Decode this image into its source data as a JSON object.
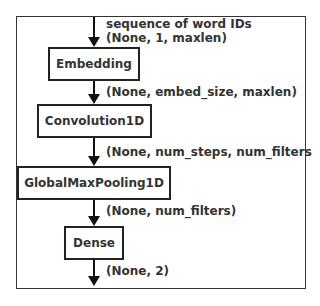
{
  "diagram": {
    "type": "model-architecture-flowchart",
    "nodes": [
      {
        "id": "embedding",
        "label": "Embedding"
      },
      {
        "id": "conv1d",
        "label": "Convolution1D"
      },
      {
        "id": "gmp1d",
        "label": "GlobalMaxPooling1D"
      },
      {
        "id": "dense",
        "label": "Dense"
      }
    ],
    "edges": [
      {
        "from": "input",
        "to": "embedding",
        "label_line1": "sequence of word IDs",
        "label_line2": "(None, 1, maxlen)"
      },
      {
        "from": "embedding",
        "to": "conv1d",
        "label": "(None, embed_size, maxlen)"
      },
      {
        "from": "conv1d",
        "to": "gmp1d",
        "label": "(None, num_steps, num_filters"
      },
      {
        "from": "gmp1d",
        "to": "dense",
        "label": "(None, num_filters)"
      },
      {
        "from": "dense",
        "to": "output",
        "label": "(None, 2)"
      }
    ]
  }
}
